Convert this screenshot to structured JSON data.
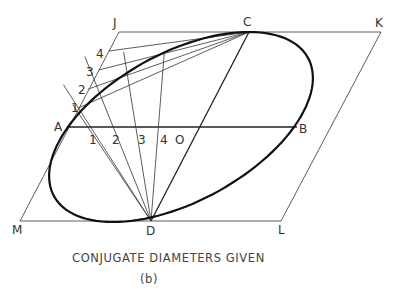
{
  "figure": {
    "caption": "CONJUGATE DIAMETERS GIVEN",
    "sublabel": "(b)"
  },
  "points": {
    "J": "J",
    "C": "C",
    "K": "K",
    "A": "A",
    "O": "O",
    "B": "B",
    "M": "M",
    "D": "D",
    "L": "L"
  },
  "aj_divisions": [
    "1",
    "2",
    "3",
    "4"
  ],
  "ao_divisions": [
    "1",
    "2",
    "3",
    "4"
  ]
}
